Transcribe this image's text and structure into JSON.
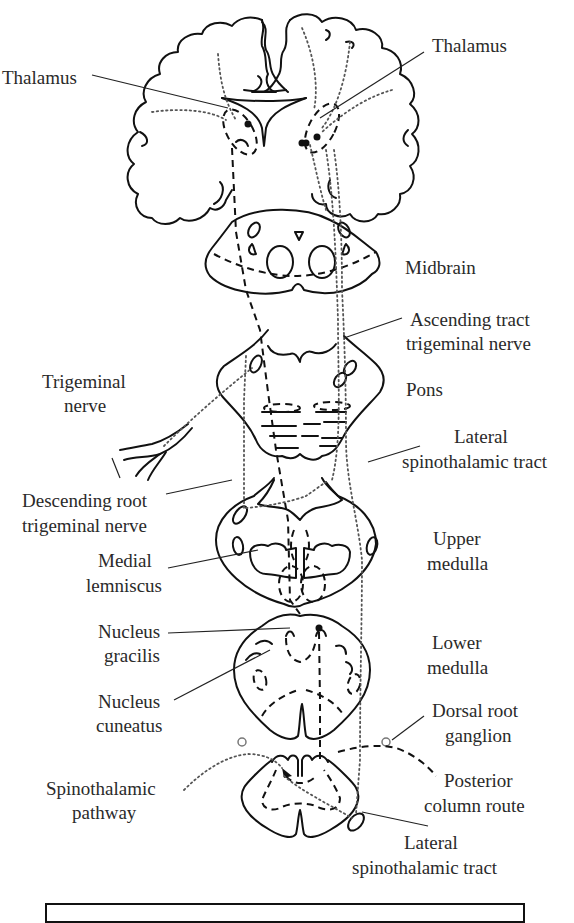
{
  "diagram": {
    "type": "neuroanatomical pathway diagram",
    "colors": {
      "line": "#111111",
      "text": "#2a2a2a",
      "background": "#ffffff"
    },
    "line_styles": {
      "dashed": "posterior column route (medial lemniscus pathway)",
      "dotted": "spinothalamic / trigeminal pathways"
    },
    "labels": {
      "thalamus_left": "Thalamus",
      "thalamus_right": "Thalamus",
      "midbrain": "Midbrain",
      "ascending_tract_1": "Ascending tract",
      "ascending_tract_2": "trigeminal nerve",
      "trigeminal_nerve_1": "Trigeminal",
      "trigeminal_nerve_2": "nerve",
      "pons": "Pons",
      "lateral_st_upper_1": "Lateral",
      "lateral_st_upper_2": "spinothalamic tract",
      "descending_root_1": "Descending root",
      "descending_root_2": "trigeminal nerve",
      "upper_medulla_1": "Upper",
      "upper_medulla_2": "medulla",
      "medial_lemniscus_1": "Medial",
      "medial_lemniscus_2": "lemniscus",
      "nucleus_gracilis_1": "Nucleus",
      "nucleus_gracilis_2": "gracilis",
      "lower_medulla_1": "Lower",
      "lower_medulla_2": "medulla",
      "nucleus_cuneatus_1": "Nucleus",
      "nucleus_cuneatus_2": "cuneatus",
      "dorsal_root_ganglion_1": "Dorsal root",
      "dorsal_root_ganglion_2": "ganglion",
      "spinothalamic_pathway_1": "Spinothalamic",
      "spinothalamic_pathway_2": "pathway",
      "posterior_column_1": "Posterior",
      "posterior_column_2": "column route",
      "lateral_st_lower_1": "Lateral",
      "lateral_st_lower_2": "spinothalamic tract"
    },
    "structures": [
      "cerebrum (coronal section)",
      "thalamus",
      "midbrain",
      "pons",
      "upper medulla",
      "lower medulla",
      "spinal cord"
    ]
  }
}
